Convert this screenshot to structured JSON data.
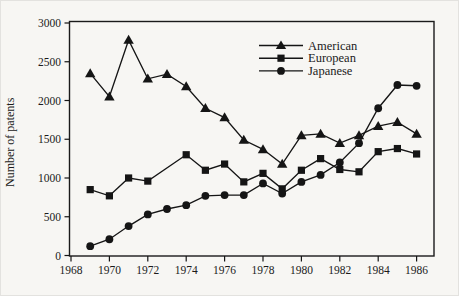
{
  "chart_data": {
    "type": "line",
    "title": "",
    "ylabel": "Number of patents",
    "xlabel": "",
    "x": [
      1969,
      1970,
      1971,
      1972,
      1973,
      1974,
      1975,
      1976,
      1977,
      1978,
      1979,
      1980,
      1981,
      1982,
      1983,
      1984,
      1985,
      1986
    ],
    "series": [
      {
        "name": "American",
        "marker": "triangle",
        "values": [
          2350,
          2050,
          2780,
          2280,
          2340,
          2180,
          1900,
          1780,
          1490,
          1370,
          1180,
          1550,
          1570,
          1450,
          1550,
          1670,
          1720,
          1570
        ]
      },
      {
        "name": "European",
        "marker": "square",
        "values": [
          850,
          770,
          1000,
          960,
          null,
          1300,
          1100,
          1180,
          950,
          1060,
          860,
          1100,
          1250,
          1110,
          1080,
          1340,
          1380,
          1310
        ]
      },
      {
        "name": "Japanese",
        "marker": "circle",
        "values": [
          120,
          210,
          380,
          530,
          600,
          650,
          770,
          780,
          780,
          930,
          800,
          950,
          1040,
          1200,
          1450,
          1900,
          2200,
          2190
        ]
      }
    ],
    "xlim": [
      1968,
      1987
    ],
    "ylim": [
      0,
      3000
    ],
    "x_ticks": [
      1968,
      1970,
      1972,
      1974,
      1976,
      1978,
      1980,
      1982,
      1984,
      1986
    ],
    "y_ticks": [
      0,
      500,
      1000,
      1500,
      2000,
      2500,
      3000
    ],
    "grid": "off",
    "legend_position": "top-right-inside",
    "line_color": "#151515"
  }
}
